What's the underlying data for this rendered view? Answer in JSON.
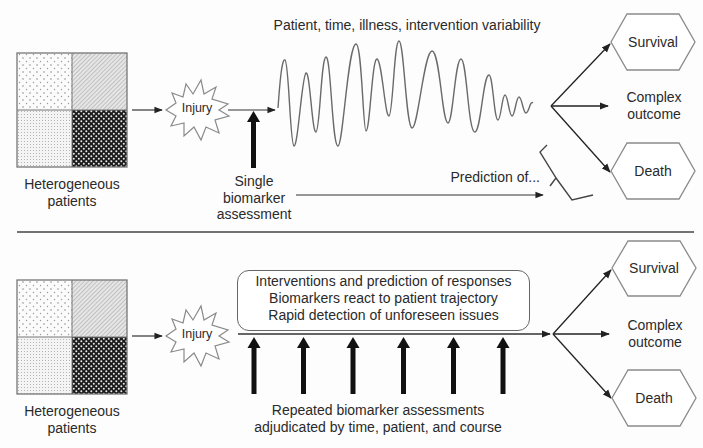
{
  "top_panel": {
    "patients_label_1": "Heterogeneous",
    "patients_label_2": "patients",
    "injury_label": "Injury",
    "variability_label": "Patient, time, illness, intervention variability",
    "biomarker_label_1": "Single",
    "biomarker_label_2": "biomarker",
    "biomarker_label_3": "assessment",
    "prediction_label": "Prediction of...",
    "outcomes": {
      "survival": "Survival",
      "complex_1": "Complex",
      "complex_2": "outcome",
      "death": "Death"
    }
  },
  "bottom_panel": {
    "patients_label_1": "Heterogeneous",
    "patients_label_2": "patients",
    "injury_label": "Injury",
    "info_box": [
      "Interventions and prediction of responses",
      "Biomarkers react to patient trajectory",
      "Rapid detection of unforeseen issues"
    ],
    "assessments_label_1": "Repeated biomarker assessments",
    "assessments_label_2": "adjudicated by time, patient, and course",
    "assessment_arrow_count": 6,
    "outcomes": {
      "survival": "Survival",
      "complex_1": "Complex",
      "complex_2": "outcome",
      "death": "Death"
    }
  },
  "colors": {
    "ink": "#2a2a2a",
    "line": "#333333",
    "shape_outline": "#8a8a8a",
    "arrow_fill": "#111111"
  }
}
